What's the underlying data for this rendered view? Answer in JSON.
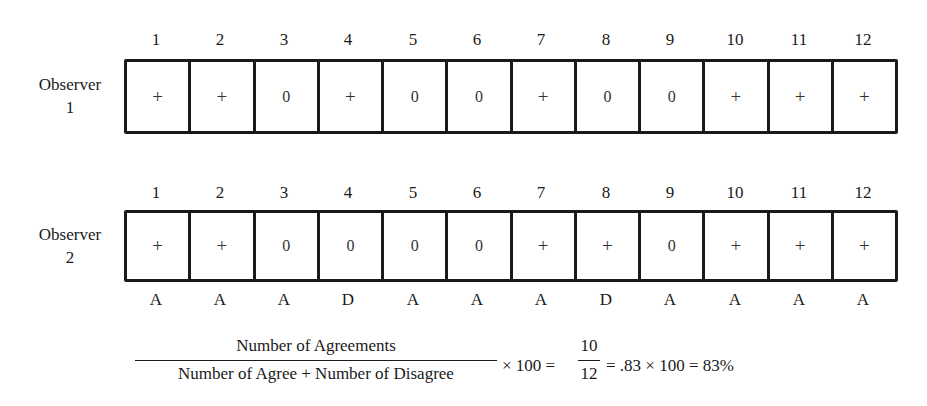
{
  "columns": [
    "1",
    "2",
    "3",
    "4",
    "5",
    "6",
    "7",
    "8",
    "9",
    "10",
    "11",
    "12"
  ],
  "observer1": {
    "label_line1": "Observer",
    "label_line2": "1",
    "cells": [
      "+",
      "+",
      "0",
      "+",
      "0",
      "0",
      "+",
      "0",
      "0",
      "+",
      "+",
      "+"
    ]
  },
  "observer2": {
    "label_line1": "Observer",
    "label_line2": "2",
    "cells": [
      "+",
      "+",
      "0",
      "0",
      "0",
      "0",
      "+",
      "+",
      "0",
      "+",
      "+",
      "+"
    ]
  },
  "agreement": [
    "A",
    "A",
    "A",
    "D",
    "A",
    "A",
    "A",
    "D",
    "A",
    "A",
    "A",
    "A"
  ],
  "formula": {
    "numerator": "Number of Agreements",
    "denominator": "Number of Agree + Number of Disagree",
    "times_100": "× 100 =",
    "frac_num": "10",
    "frac_den": "12",
    "result": "= .83 × 100 = 83%"
  }
}
